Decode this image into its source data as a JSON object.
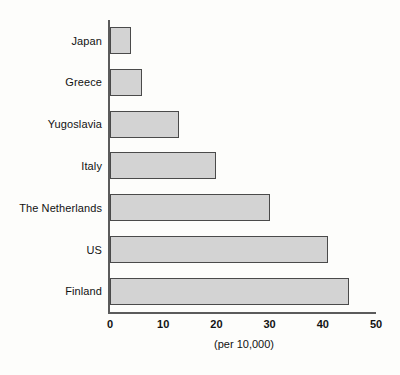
{
  "chart_data": {
    "type": "bar",
    "orientation": "horizontal",
    "title": "",
    "subtitle": "",
    "xlabel": "(per 10,000)",
    "ylabel": "",
    "categories": [
      "Japan",
      "Greece",
      "Yugoslavia",
      "Italy",
      "The Netherlands",
      "US",
      "Finland"
    ],
    "values": [
      4,
      6,
      13,
      20,
      30,
      41,
      45
    ],
    "xlim": [
      0,
      50
    ],
    "xticks": [
      0,
      10,
      20,
      30,
      40,
      50
    ],
    "xtick_labels": [
      "0",
      "10",
      "20",
      "30",
      "40",
      "50"
    ],
    "grid": false,
    "legend": null,
    "bar_fill_color": "#d3d3d3",
    "bar_border_color": "#4a4a4a",
    "axis_color": "#5b5b5b",
    "background_color": "#fdfdfb",
    "text_color": "#121212",
    "annotations": []
  }
}
